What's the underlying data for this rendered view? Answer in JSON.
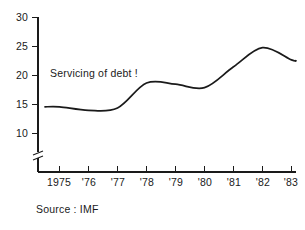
{
  "chart_data": {
    "type": "line",
    "title": "",
    "subtitle": "",
    "xlabel": "",
    "ylabel": "",
    "categories": [
      "1975",
      "'76",
      "'77",
      "'78",
      "'79",
      "'80",
      "'81",
      "'82",
      "'83"
    ],
    "x": [
      1975,
      1976,
      1977,
      1978,
      1979,
      1980,
      1981,
      1982,
      1983
    ],
    "values": [
      14.6,
      14.0,
      14.4,
      18.7,
      18.5,
      17.9,
      21.5,
      24.8,
      22.7
    ],
    "series": [
      {
        "name": "Servicing of debt !",
        "values": [
          14.6,
          14.0,
          14.4,
          18.7,
          18.5,
          17.9,
          21.5,
          24.8,
          22.7
        ]
      }
    ],
    "ylim": [
      10,
      30
    ],
    "yticks": [
      10,
      15,
      20,
      25,
      30
    ],
    "ytick_labels": [
      "10",
      "15",
      "20",
      "25",
      "30"
    ],
    "xtick_labels": [
      "1975",
      "'76",
      "'77",
      "'78",
      "'79",
      "'80",
      "'81",
      "'82",
      "'83"
    ],
    "grid": false,
    "legend_position": "none",
    "axis_break": true,
    "axis_break_note": "broken y-axis below 10",
    "line_color": "#1a1a1a",
    "axis_color": "#1a1a1a",
    "background_color": "#ffffff"
  },
  "annotations": {
    "series_label": "Servicing of debt !",
    "source_note": "Source : IMF"
  }
}
